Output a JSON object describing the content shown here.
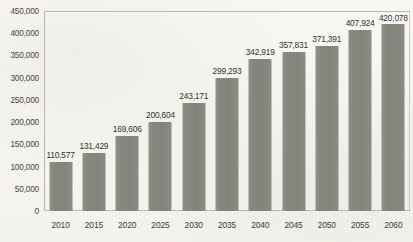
{
  "chart_data": {
    "type": "bar",
    "title": "",
    "subtitle": "",
    "xlabel": "",
    "ylabel": "",
    "categories": [
      "2010",
      "2015",
      "2020",
      "2025",
      "2030",
      "2035",
      "2040",
      "2045",
      "2050",
      "2055",
      "2060"
    ],
    "values": [
      110577,
      131429,
      169606,
      200604,
      243171,
      299293,
      342919,
      357831,
      371391,
      407924,
      420078
    ],
    "value_labels": [
      "110,577",
      "131,429",
      "169,606",
      "200,604",
      "243,171",
      "299,293",
      "342,919",
      "357,831",
      "371,391",
      "407,924",
      "420,078"
    ],
    "ylim": [
      0,
      450000
    ],
    "y_ticks": [
      0,
      50000,
      100000,
      150000,
      200000,
      250000,
      300000,
      350000,
      400000,
      450000
    ],
    "y_tick_labels": [
      "0",
      "50,000",
      "100,000",
      "150,000",
      "200,000",
      "250,000",
      "300,000",
      "350,000",
      "400,000",
      "450,000"
    ],
    "grid": false,
    "legend": null,
    "legend_position": "none",
    "series": [
      {
        "name": "",
        "values": [
          110577,
          131429,
          169606,
          200604,
          243171,
          299293,
          342919,
          357831,
          371391,
          407924,
          420078
        ]
      }
    ],
    "colors": {
      "bar_fill": "#87867f",
      "background": "#f7f6f2",
      "axis_line": "#b9b7ad",
      "tick_text": "#46463f",
      "value_text": "#33332e"
    }
  }
}
